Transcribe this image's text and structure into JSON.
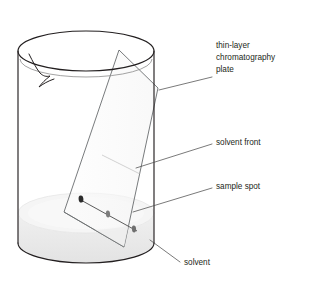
{
  "diagram": {
    "type": "labelled-science-diagram",
    "background_color": "#ffffff",
    "line_color": "#231f20",
    "text_color": "#231f20"
  },
  "labels": {
    "plate_line1": "thin-layer",
    "plate_line2": "chromatography",
    "plate_line3": "plate",
    "solvent_front": "solvent front",
    "sample_spot": "sample spot",
    "solvent": "solvent"
  },
  "objects": {
    "beaker": {
      "name": "beaker",
      "fill": "#ffffff",
      "stroke": "#231f20",
      "has_spout": true
    },
    "solvent_liquid": {
      "name": "solvent",
      "fill": "#eeeeee",
      "surface_fill": "#f4f4f4"
    },
    "tlc_plate": {
      "name": "thin-layer chromatography plate",
      "fill": "#fafafa",
      "stroke": "#4a4a4a",
      "immersed_fill": "#efefef"
    },
    "solvent_front_line": {
      "name": "solvent front",
      "stroke": "#8c8c8c"
    }
  },
  "spots": [
    {
      "id": "spot-1",
      "color": "#2b2b2b",
      "size": "large"
    },
    {
      "id": "spot-2",
      "color": "#7b7b7b",
      "size": "medium"
    },
    {
      "id": "spot-3",
      "color": "#6e6e6e",
      "size": "medium"
    }
  ]
}
